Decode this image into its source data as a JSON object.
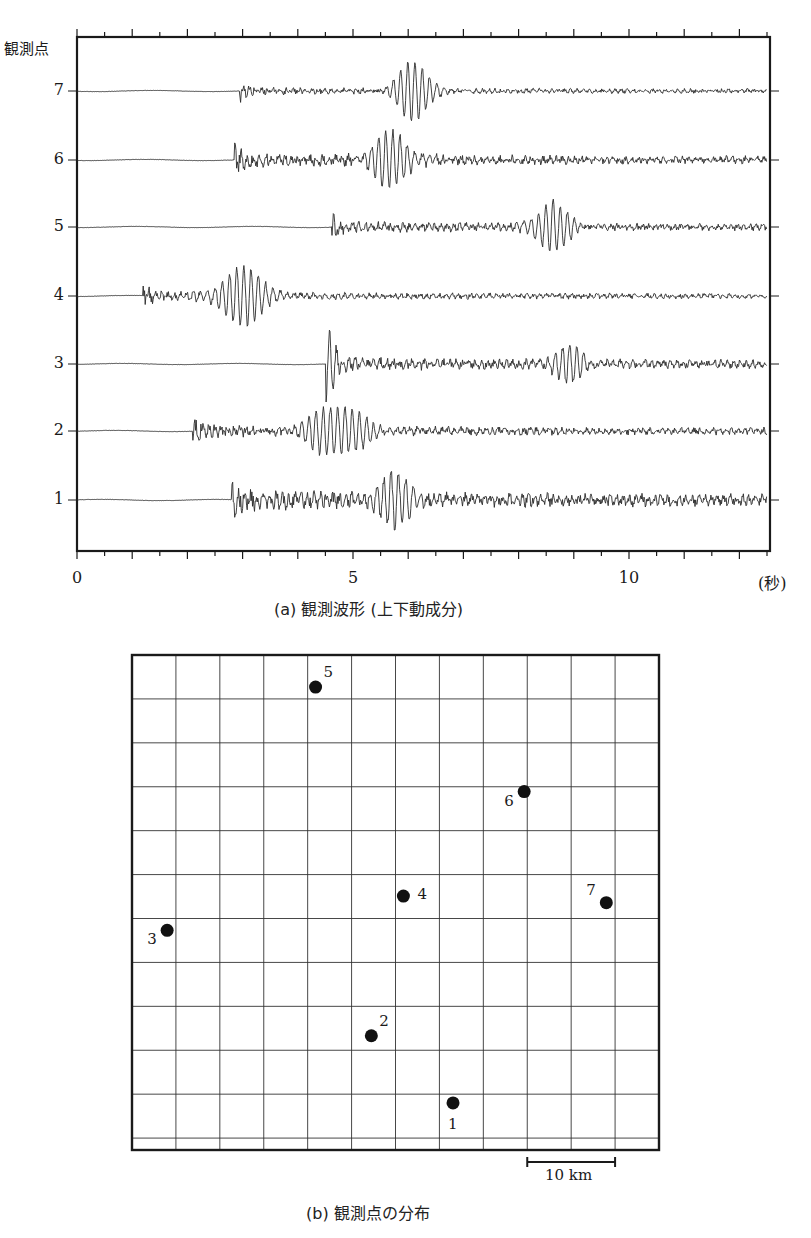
{
  "figure_a": {
    "caption": "(a) 観測波形 (上下動成分)",
    "y_title": "観測点",
    "x_unit": "(秒)",
    "x_ticks": [
      {
        "value": 0,
        "label": "0"
      },
      {
        "value": 5,
        "label": "5"
      },
      {
        "value": 10,
        "label": "10"
      }
    ]
  },
  "figure_b": {
    "caption": "(b) 観測点の分布",
    "scale_bar_label": "10 km"
  },
  "chart_data": [
    {
      "type": "line",
      "title": "(a) 観測波形 (上下動成分)",
      "xlabel": "(秒)",
      "ylabel": "観測点",
      "xlim": [
        0,
        12.5
      ],
      "x_major_ticks": [
        0,
        1,
        2,
        3,
        4,
        5,
        6,
        7,
        8,
        9,
        10,
        11,
        12
      ],
      "x_minor_step": 0.5,
      "x_tick_labels": [
        "0",
        "5",
        "10"
      ],
      "grid": false,
      "series": [
        {
          "name": "7",
          "onset_s": 2.95,
          "bursts": [
            {
              "center_s": 6.1,
              "amp": 1.0,
              "width_s": 0.35
            }
          ],
          "noise_amp": 0.12
        },
        {
          "name": "6",
          "onset_s": 2.85,
          "bursts": [
            {
              "center_s": 5.7,
              "amp": 0.9,
              "width_s": 0.45
            }
          ],
          "noise_amp": 0.22
        },
        {
          "name": "5",
          "onset_s": 4.6,
          "bursts": [
            {
              "center_s": 8.6,
              "amp": 0.85,
              "width_s": 0.35
            }
          ],
          "noise_amp": 0.18
        },
        {
          "name": "4",
          "onset_s": 1.2,
          "bursts": [
            {
              "center_s": 3.0,
              "amp": 0.95,
              "width_s": 0.5
            }
          ],
          "noise_amp": 0.15
        },
        {
          "name": "3",
          "onset_s": 4.5,
          "bursts": [
            {
              "center_s": 4.55,
              "amp": 1.0,
              "width_s": 0.15
            },
            {
              "center_s": 8.9,
              "amp": 0.55,
              "width_s": 0.4
            }
          ],
          "noise_amp": 0.22
        },
        {
          "name": "2",
          "onset_s": 2.1,
          "bursts": [
            {
              "center_s": 4.7,
              "amp": 0.85,
              "width_s": 0.6
            }
          ],
          "noise_amp": 0.2
        },
        {
          "name": "1",
          "onset_s": 2.8,
          "bursts": [
            {
              "center_s": 5.8,
              "amp": 0.95,
              "width_s": 0.35
            }
          ],
          "noise_amp": 0.32
        }
      ]
    },
    {
      "type": "scatter",
      "title": "(b) 観測点の分布",
      "grid": true,
      "grid_cell_km": 5,
      "grid_cols": 12,
      "grid_rows": 11.25,
      "scale_bar": {
        "label": "10 km",
        "cells": 2
      },
      "points": [
        {
          "label": "1",
          "col": 7.31,
          "row": 10.2,
          "label_pos": "below"
        },
        {
          "label": "2",
          "col": 5.45,
          "row": 8.67,
          "label_pos": "upper-right"
        },
        {
          "label": "3",
          "col": 0.8,
          "row": 6.27,
          "label_pos": "lower-left"
        },
        {
          "label": "4",
          "col": 6.18,
          "row": 5.49,
          "label_pos": "right"
        },
        {
          "label": "5",
          "col": 4.18,
          "row": 0.73,
          "label_pos": "upper-right"
        },
        {
          "label": "6",
          "col": 8.93,
          "row": 3.11,
          "label_pos": "lower-left"
        },
        {
          "label": "7",
          "col": 10.8,
          "row": 5.64,
          "label_pos": "upper-left"
        }
      ]
    }
  ]
}
